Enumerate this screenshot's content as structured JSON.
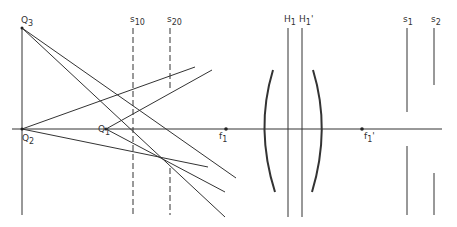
{
  "diagram": {
    "labels": {
      "q3": {
        "main": "Q",
        "sub": "3"
      },
      "q2": {
        "main": "Q",
        "sub": "2"
      },
      "q1": {
        "main": "Q",
        "sub": "1"
      },
      "s10": {
        "main": "s",
        "sub": "10"
      },
      "s20": {
        "main": "s",
        "sub": "20"
      },
      "f1": {
        "main": "f",
        "sub": "1"
      },
      "f1p": {
        "main": "f",
        "sub": "1",
        "prime": "'"
      },
      "h1": {
        "main": "H",
        "sub": "1"
      },
      "h1p": {
        "main": "H",
        "sub": "1",
        "prime": "'"
      },
      "s1": {
        "main": "s",
        "sub": "1"
      },
      "s2": {
        "main": "s",
        "sub": "2"
      }
    },
    "colors": {
      "line": "#333333",
      "background": "#ffffff"
    }
  }
}
